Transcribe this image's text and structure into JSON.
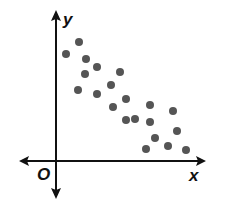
{
  "chart_data": {
    "type": "scatter",
    "title": "",
    "xlabel": "x",
    "ylabel": "y",
    "origin_label": "O",
    "grid": false,
    "legend": null,
    "axis_ticks": false,
    "trend": "negative correlation",
    "colors": {
      "points": "#555555",
      "axes": "#111111"
    },
    "pixel_axes": {
      "origin_x": 56,
      "origin_y": 161
    },
    "points": [
      {
        "x": 66,
        "y": 54
      },
      {
        "x": 79,
        "y": 42
      },
      {
        "x": 86,
        "y": 59
      },
      {
        "x": 85,
        "y": 74
      },
      {
        "x": 97,
        "y": 67
      },
      {
        "x": 78,
        "y": 90
      },
      {
        "x": 97,
        "y": 94
      },
      {
        "x": 111,
        "y": 85
      },
      {
        "x": 120,
        "y": 72
      },
      {
        "x": 113,
        "y": 107
      },
      {
        "x": 126,
        "y": 99
      },
      {
        "x": 126,
        "y": 120
      },
      {
        "x": 135,
        "y": 119
      },
      {
        "x": 150,
        "y": 105
      },
      {
        "x": 150,
        "y": 122
      },
      {
        "x": 173,
        "y": 111
      },
      {
        "x": 155,
        "y": 138
      },
      {
        "x": 177,
        "y": 131
      },
      {
        "x": 146,
        "y": 149
      },
      {
        "x": 168,
        "y": 146
      },
      {
        "x": 186,
        "y": 150
      }
    ]
  }
}
